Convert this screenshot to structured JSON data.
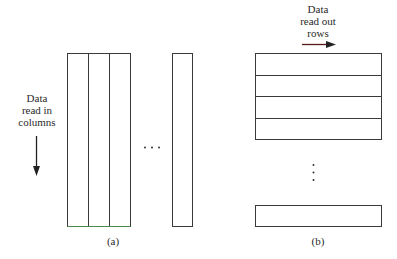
{
  "panel_a": {
    "label": "(a)",
    "annotation": [
      "Data",
      "read in",
      "columns"
    ],
    "ellipsis": "· · ·",
    "columns_shown": 4
  },
  "panel_b": {
    "label": "(b)",
    "annotation": [
      "Data",
      "read out",
      "rows"
    ],
    "ellipsis_vertical": "⋮",
    "rows_shown": 5
  },
  "colors": {
    "stroke": "#3a3a3a",
    "arrow_b": "#5a1a1a",
    "bottom_edge_a": "#4f8a4f"
  }
}
